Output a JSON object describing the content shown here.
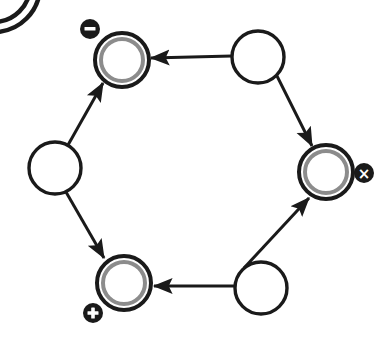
{
  "canvas": {
    "width": 391,
    "height": 346,
    "background": "#ffffff"
  },
  "palette": {
    "stroke": "#1a1a1a",
    "node_fill": "#ffffff",
    "inner_ring": "#8c8c8c",
    "badge_fill": "#1a1a1a",
    "badge_glyph": "#ffffff"
  },
  "diagram": {
    "type": "directed-cycle-graph",
    "shape": "hexagon",
    "node_count": 6,
    "edge_count": 6,
    "nodes": [
      {
        "id": "node-top-left",
        "name": "top-left-node",
        "style": "double-ring",
        "cx": 122,
        "cy": 60,
        "r": 27,
        "inner_r": 21,
        "badge": {
          "name": "minus-badge",
          "glyph": "–",
          "label": "minus",
          "cx": 90,
          "cy": 29,
          "r": 10
        }
      },
      {
        "id": "node-top-right",
        "name": "top-right-node",
        "style": "plain",
        "cx": 258,
        "cy": 57,
        "r": 26,
        "badge": null
      },
      {
        "id": "node-right",
        "name": "right-node",
        "style": "double-ring",
        "cx": 326,
        "cy": 172,
        "r": 27,
        "inner_r": 21,
        "badge": {
          "name": "times-badge",
          "glyph": "×",
          "label": "times",
          "cx": 364,
          "cy": 173,
          "r": 10
        }
      },
      {
        "id": "node-bottom-right",
        "name": "bottom-right-node",
        "style": "plain",
        "cx": 261,
        "cy": 288,
        "r": 26,
        "badge": null
      },
      {
        "id": "node-bottom-left",
        "name": "bottom-left-node",
        "style": "double-ring",
        "cx": 124,
        "cy": 283,
        "r": 27,
        "inner_r": 21,
        "badge": {
          "name": "plus-badge",
          "glyph": "+",
          "label": "plus",
          "cx": 93,
          "cy": 313,
          "r": 10
        }
      },
      {
        "id": "node-left",
        "name": "left-node",
        "style": "plain",
        "cx": 55,
        "cy": 168,
        "r": 26,
        "badge": null
      }
    ],
    "edges": [
      {
        "id": "edge-top-right-to-top-left",
        "name": "edge-top-right-to-top-left",
        "from": "node-top-right",
        "to": "node-top-left",
        "x1": 232,
        "y1": 56,
        "x2": 151,
        "y2": 58,
        "directed": true
      },
      {
        "id": "edge-top-right-to-right",
        "name": "edge-top-right-to-right",
        "from": "node-top-right",
        "to": "node-right",
        "x1": 277,
        "y1": 76,
        "x2": 312,
        "y2": 146,
        "directed": true
      },
      {
        "id": "edge-bottom-right-to-right",
        "name": "edge-bottom-right-to-right",
        "from": "node-bottom-right",
        "to": "node-right",
        "x1": 244,
        "y1": 268,
        "x2": 309,
        "y2": 198,
        "directed": true
      },
      {
        "id": "edge-bottom-right-to-bottom-left",
        "name": "edge-bottom-right-to-bottom-left",
        "from": "node-bottom-right",
        "to": "node-bottom-left",
        "x1": 235,
        "y1": 286,
        "x2": 154,
        "y2": 286,
        "directed": true
      },
      {
        "id": "edge-left-to-top-left",
        "name": "edge-left-to-top-left",
        "from": "node-left",
        "to": "node-top-left",
        "x1": 68,
        "y1": 145,
        "x2": 103,
        "y2": 83,
        "directed": true
      },
      {
        "id": "edge-left-to-bottom-left",
        "name": "edge-left-to-bottom-left",
        "from": "node-left",
        "to": "node-bottom-left",
        "x1": 66,
        "y1": 192,
        "x2": 104,
        "y2": 258,
        "directed": true
      }
    ],
    "clipped_arcs": {
      "name": "corner-arc-fragment",
      "description": "partially visible nested arcs at top-left corner",
      "cx": -6,
      "cy": -14,
      "outer_r": 46,
      "inner_r": 36
    }
  }
}
